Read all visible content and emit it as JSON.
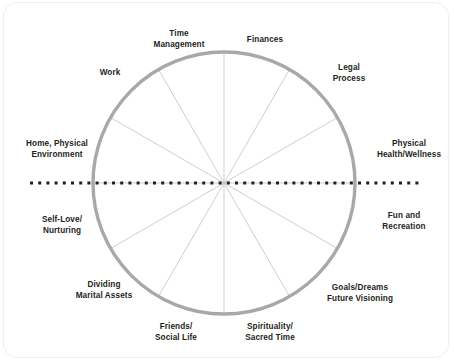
{
  "figure": {
    "name": "wheel-of-life-diagram",
    "shape": "circle-with-twelve-spokes",
    "sector_count": 12,
    "colors": {
      "circle_stroke": "#a8a8a8",
      "spoke_stroke": "#b9b9b9",
      "dotted_axis": "#231f20",
      "label_text": "#231f20",
      "frame_border": "#efefef",
      "background": "#ffffff"
    },
    "geometry": {
      "center_x": 224,
      "center_y": 183,
      "radius": 131,
      "circle_stroke_width": 3.4,
      "spoke_stroke_width": 0.7,
      "dotted_axis_y": 183,
      "dotted_axis_start_x": 30,
      "dotted_axis_end_x": 422,
      "dotted_axis_dot_size": 3,
      "dotted_axis_gap": 5.2
    },
    "spoke_angles_deg": [
      0,
      30,
      60,
      90,
      120,
      150,
      180,
      210,
      240,
      270,
      300,
      330
    ]
  },
  "labels": [
    {
      "id": "time-management",
      "text": "Time\nManagement",
      "x": 179,
      "y": 40
    },
    {
      "id": "finances",
      "text": "Finances",
      "x": 265,
      "y": 40
    },
    {
      "id": "legal-process",
      "text": "Legal\nProcess",
      "x": 349,
      "y": 74
    },
    {
      "id": "work",
      "text": "Work",
      "x": 110,
      "y": 73
    },
    {
      "id": "home-physical-environment",
      "text": "Home, Physical\nEnvironment",
      "x": 57,
      "y": 150
    },
    {
      "id": "physical-health-wellness",
      "text": "Physical\nHealth/Wellness",
      "x": 409,
      "y": 150
    },
    {
      "id": "self-love-nurturing",
      "text": "Self-Love/\nNurturing",
      "x": 62,
      "y": 226
    },
    {
      "id": "fun-and-recreation",
      "text": "Fun and\nRecreation",
      "x": 404,
      "y": 222
    },
    {
      "id": "dividing-marital-assets",
      "text": "Dividing\nMarital Assets",
      "x": 104,
      "y": 291
    },
    {
      "id": "goals-dreams-future-visioning",
      "text": "Goals/Dreams\nFuture Visioning",
      "x": 360,
      "y": 294
    },
    {
      "id": "friends-social-life",
      "text": "Friends/\nSocial Life",
      "x": 176,
      "y": 333
    },
    {
      "id": "spirituality-sacred-time",
      "text": "Spirituality/\nSacred Time",
      "x": 270,
      "y": 333
    }
  ]
}
